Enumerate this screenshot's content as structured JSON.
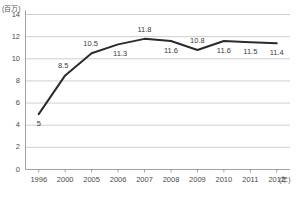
{
  "chart_data": {
    "type": "line",
    "title": "",
    "xlabel": "(年)",
    "ylabel": "(百万)",
    "categories": [
      "1996",
      "2000",
      "2005",
      "2006",
      "2007",
      "2008",
      "2009",
      "2010",
      "2011",
      "2012"
    ],
    "values": [
      5,
      8.5,
      10.5,
      11.3,
      11.8,
      11.6,
      10.8,
      11.6,
      11.5,
      11.4
    ],
    "point_labels": [
      "5",
      "8.5",
      "10.5",
      "11.3",
      "11.8",
      "11.6",
      "10.8",
      "11.6",
      "11.5",
      "11.4"
    ],
    "ylim": [
      0,
      14
    ],
    "yticks": [
      0,
      2,
      4,
      6,
      8,
      10,
      12,
      14
    ],
    "ytick_labels": [
      "0",
      "2",
      "4",
      "6",
      "8",
      "10",
      "12",
      "14"
    ],
    "grid": true,
    "legend": "none",
    "series_color": "#2b2b2b",
    "grid_color": "#b9b9b9",
    "axis_color": "#8a8a8a",
    "text_color": "#4a4a4a"
  },
  "axes": {
    "y_unit": "(百万)",
    "x_unit": "(年)"
  }
}
